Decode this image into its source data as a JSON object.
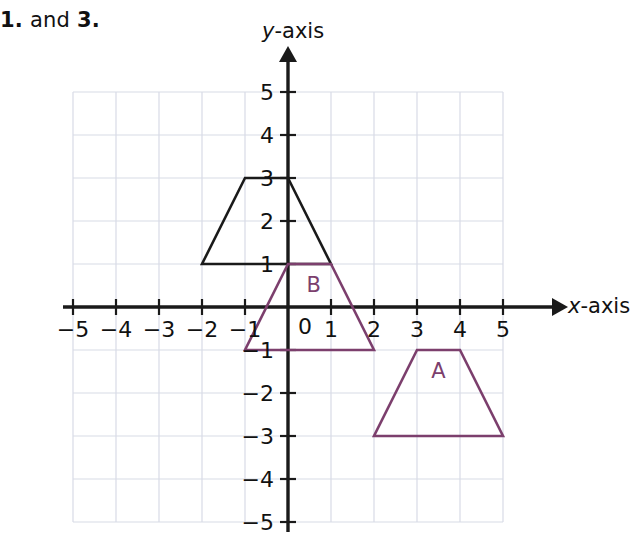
{
  "heading": {
    "first_number": "1.",
    "conjunction": "and",
    "second_number": "3."
  },
  "colors": {
    "axis": "#1a1a1a",
    "grid": "#d8dbe6",
    "shape_black": "#1a1a1a",
    "shape_purple": "#7c3f6d",
    "text": "#111111"
  },
  "chart_data": {
    "type": "scatter",
    "title": "",
    "xlabel": "x-axis",
    "ylabel": "y-axis",
    "xlim": [
      -5,
      5
    ],
    "ylim": [
      -5,
      5
    ],
    "grid": true,
    "legend": "none",
    "x_tick_labels": [
      "−5",
      "−4",
      "−3",
      "−2",
      "−1",
      "1",
      "2",
      "3",
      "4",
      "5"
    ],
    "x_tick_values": [
      -5,
      -4,
      -3,
      -2,
      -1,
      1,
      2,
      3,
      4,
      5
    ],
    "y_tick_labels": [
      "5",
      "4",
      "3",
      "2",
      "1",
      "−1",
      "−2",
      "−3",
      "−4",
      "−5"
    ],
    "y_tick_values": [
      5,
      4,
      3,
      2,
      1,
      -1,
      -2,
      -3,
      -4,
      -5
    ],
    "origin_label": "0",
    "shapes": [
      {
        "name": "image-trapezoid",
        "label": "",
        "color": "#1a1a1a",
        "vertices": [
          [
            -1,
            3
          ],
          [
            0,
            3
          ],
          [
            1,
            1
          ],
          [
            -2,
            1
          ]
        ]
      },
      {
        "name": "trapezoid-B",
        "label": "B",
        "label_position": [
          0.6,
          0.35
        ],
        "color": "#7c3f6d",
        "vertices": [
          [
            0,
            1
          ],
          [
            1,
            1
          ],
          [
            2,
            -1
          ],
          [
            -1,
            -1
          ]
        ]
      },
      {
        "name": "trapezoid-A",
        "label": "A",
        "label_position": [
          3.5,
          -1.65
        ],
        "color": "#7c3f6d",
        "vertices": [
          [
            3,
            -1
          ],
          [
            4,
            -1
          ],
          [
            5,
            -3
          ],
          [
            2,
            -3
          ]
        ]
      }
    ]
  }
}
